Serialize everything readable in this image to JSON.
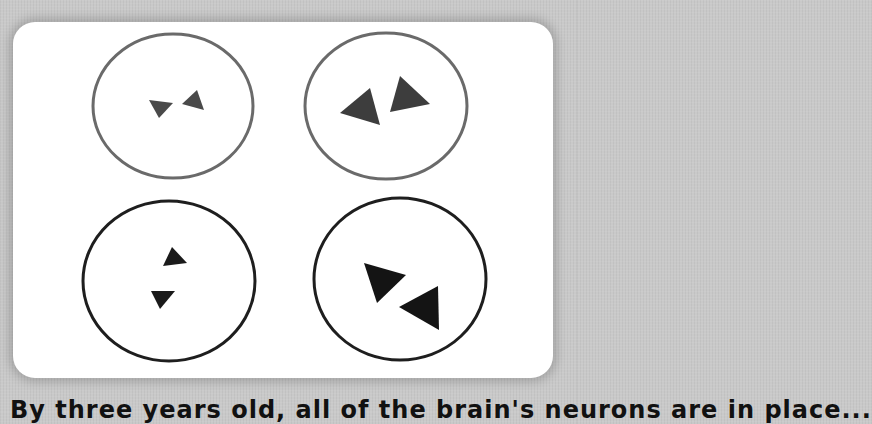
{
  "figure": {
    "panels": [
      {
        "id": "top-left",
        "ring_color": "#6a6a6a",
        "triangle_color": "#4a4a4a",
        "triangle_size": "small",
        "arrangement": "side-by-side"
      },
      {
        "id": "top-right",
        "ring_color": "#6a6a6a",
        "triangle_color": "#3d3d3d",
        "triangle_size": "large",
        "arrangement": "side-by-side"
      },
      {
        "id": "bottom-left",
        "ring_color": "#1e1e1e",
        "triangle_color": "#1a1a1a",
        "triangle_size": "small",
        "arrangement": "stacked"
      },
      {
        "id": "bottom-right",
        "ring_color": "#1e1e1e",
        "triangle_color": "#141414",
        "triangle_size": "large",
        "arrangement": "diagonal"
      }
    ]
  },
  "caption": {
    "text": "By three years old, all of the brain's neurons are in place..."
  },
  "colors": {
    "background": "#c9c9c9",
    "card": "#ffffff"
  }
}
